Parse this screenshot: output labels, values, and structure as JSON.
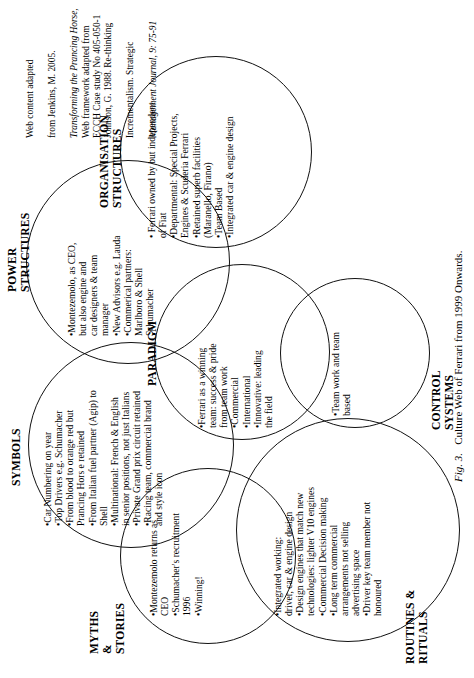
{
  "figure": {
    "number": "Fig. 3.",
    "title": "Culture Web of Ferrari from 1999 Onwards."
  },
  "references": [
    {
      "id": "web-content-source",
      "lines": [
        "Web content adapted",
        "from Jenkins, M. 2005.",
        "Transforming the Prancing Horse,",
        "ECCH Case study  No 405-050-1"
      ],
      "text": "Web content adapted from Jenkins, M. 2005. Transforming the Prancing Horse, ECCH Case study  No 405-050-1"
    },
    {
      "id": "web-framework-source",
      "lines": [
        "Web framework  adapted from",
        "Johnson, G. 1988. Re-thinking",
        "Incrementalism. Strategic",
        "Management Journal, 9: 75-91"
      ],
      "text": "Web framework  adapted from Johnson, G. 1988. Re-thinking Incrementalism. Strategic Management Journal, 9: 75-91"
    }
  ],
  "elements": {
    "paradigm": {
      "heading": "PARADIGM",
      "bullets": "•Ferrari as a winning\nteam: success & pride\nfrom team work\n•Commercial\n•International\n•Innovative: leading\nthe field"
    },
    "myths_stories": {
      "heading": "MYTHS\n&\nSTORIES",
      "bullets": "•Montezemolo returns as\nCEO\n•Schumacher's recruitment\n1996\n•Winning!"
    },
    "symbols": {
      "heading": "SYMBOLS",
      "bullets": "•Car Numbering on year\n•Top Drivers e.g. Schumacher\n•From blood to orange red but\nPrancing Hors e retained\n•From Italian fuel partner (Agip) to\nShell\n•Multinational: French & English\nin senior positions, not just Italians\n•Private Grand prix circuit retained\n•Racing team, commercial brand\nand style icon"
    },
    "power_structures": {
      "heading": "POWER\nSTRUCTURES",
      "bullets": "•Montezemolo, as CEO,\nbut also engine and\ncar designers & team\nmanager\n•New Advisors e.g. Lauda\n•Commerical partners:\nMarlboro & Shell\nSchumacher"
    },
    "organisation_structures": {
      "heading": "ORGANISATION\nSTRUCTURES",
      "bullets": "• Ferrari owned by but independent\nof Fiat\n•Departmental: Special Projects,\nEngines & Scuderia Ferrari\n•Retained superb facilities\n(Maranello, Firano)\n•Team Based\n•Integrated car & engine design"
    },
    "control_systems": {
      "heading": "CONTROL\nSYSTEMS",
      "bullets": "•Team work and team\nbased"
    },
    "routines_rituals": {
      "heading": "ROUTINES &\nRITUALS",
      "bullets": "•Integrated working:\ndriver, car & engine design\n•Design engines that match new\ntechnologies: lighter V10 engines\n•Commercial Decision making\n•Long term commercial\narrangements not selling\nadvertising space\n•Driver key team member not\nhonoured"
    }
  },
  "colors": {
    "stroke": "#111111",
    "text": "#000000",
    "background": "#ffffff"
  }
}
